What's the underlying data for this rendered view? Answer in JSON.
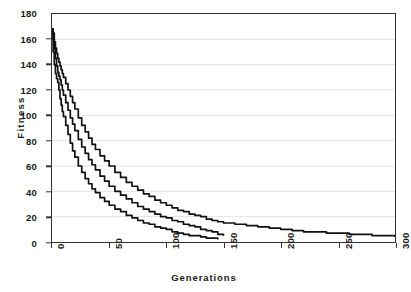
{
  "chart_data": {
    "type": "line",
    "title": "",
    "xlabel": "Generations",
    "ylabel": "Fitness",
    "xlim": [
      0,
      300
    ],
    "ylim": [
      0,
      180
    ],
    "xticks": [
      0,
      50,
      100,
      150,
      200,
      250,
      300
    ],
    "yticks": [
      0,
      20,
      40,
      60,
      80,
      100,
      120,
      140,
      160,
      180
    ],
    "grid": "horizontal",
    "legend": "none",
    "line_color": "#111111",
    "grid_color": "#e3e3e3",
    "axis_color": "#333333",
    "background": "#ffffff",
    "series": [
      {
        "name": "run-1-fast",
        "x": [
          0,
          1,
          2,
          3,
          4,
          5,
          6,
          7,
          8,
          9,
          10,
          12,
          14,
          16,
          18,
          20,
          23,
          26,
          29,
          32,
          35,
          38,
          42,
          46,
          50,
          55,
          60,
          65,
          70,
          75,
          80,
          85,
          90,
          95,
          100,
          105,
          110,
          115,
          120,
          125,
          130,
          135,
          140,
          145
        ],
        "y": [
          168,
          150,
          140,
          133,
          129,
          126,
          120,
          113,
          108,
          103,
          99,
          92,
          85,
          78,
          72,
          67,
          60,
          55,
          50,
          46,
          42,
          39,
          35,
          32,
          29,
          26,
          24,
          21,
          19,
          17,
          15,
          14,
          12,
          11,
          10,
          8,
          7,
          6,
          5,
          5,
          4,
          3,
          3,
          2
        ]
      },
      {
        "name": "run-2-medium",
        "x": [
          0,
          1,
          2,
          3,
          4,
          5,
          6,
          7,
          8,
          9,
          10,
          12,
          14,
          16,
          18,
          20,
          23,
          26,
          29,
          32,
          35,
          38,
          42,
          46,
          50,
          55,
          60,
          65,
          70,
          75,
          80,
          85,
          90,
          95,
          100,
          105,
          110,
          115,
          120,
          125,
          130,
          135,
          140,
          145,
          150
        ],
        "y": [
          168,
          160,
          152,
          145,
          139,
          134,
          131,
          128,
          124,
          120,
          116,
          110,
          104,
          98,
          93,
          88,
          81,
          75,
          70,
          65,
          61,
          57,
          52,
          48,
          44,
          40,
          37,
          34,
          31,
          28,
          26,
          24,
          22,
          20,
          19,
          17,
          16,
          14,
          13,
          12,
          10,
          9,
          8,
          6,
          5
        ]
      },
      {
        "name": "run-3-slow",
        "x": [
          0,
          1,
          2,
          3,
          4,
          5,
          6,
          7,
          8,
          9,
          10,
          12,
          14,
          16,
          18,
          20,
          23,
          26,
          29,
          32,
          35,
          38,
          42,
          46,
          50,
          55,
          60,
          65,
          70,
          75,
          80,
          85,
          90,
          95,
          100,
          105,
          110,
          115,
          120,
          125,
          130,
          135,
          140,
          145,
          150,
          160,
          170,
          180,
          190,
          200,
          210,
          220,
          230,
          240,
          250,
          260,
          270,
          280,
          290,
          300
        ],
        "y": [
          168,
          165,
          158,
          153,
          149,
          145,
          142,
          139,
          136,
          133,
          130,
          125,
          120,
          115,
          110,
          105,
          98,
          92,
          87,
          82,
          77,
          73,
          68,
          64,
          60,
          55,
          51,
          47,
          44,
          41,
          38,
          36,
          33,
          31,
          29,
          27,
          25,
          24,
          22,
          21,
          20,
          18,
          17,
          16,
          15,
          14,
          13,
          12,
          11,
          10,
          9,
          8,
          8,
          7,
          7,
          6,
          6,
          5,
          5,
          4
        ]
      }
    ]
  }
}
